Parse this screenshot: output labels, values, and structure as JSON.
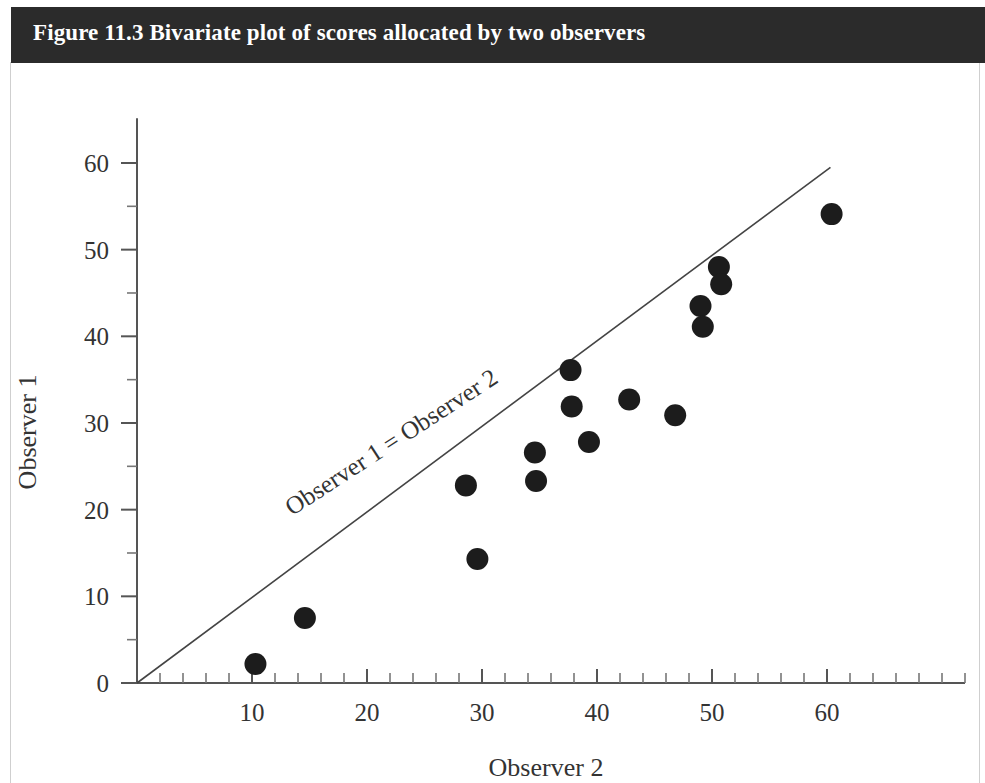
{
  "caption": {
    "text": "Figure 11.3 Bivariate plot of scores allocated by two observers",
    "bar_color": "#2b2b2b",
    "text_color": "#ffffff"
  },
  "chart_data": {
    "type": "scatter",
    "title": "Figure 11.3 Bivariate plot of scores allocated by two observers",
    "xlabel": "Observer 2",
    "ylabel": "Observer 1",
    "xlim": [
      0,
      72
    ],
    "ylim": [
      0,
      64
    ],
    "xticks": [
      10,
      20,
      30,
      40,
      50,
      60
    ],
    "yticks": [
      0,
      10,
      20,
      30,
      40,
      50,
      60
    ],
    "xtick_labels": [
      "10",
      "20",
      "30",
      "40",
      "50",
      "60"
    ],
    "ytick_labels": [
      "0",
      "10",
      "20",
      "30",
      "40",
      "50",
      "60"
    ],
    "x_minor_step": 2,
    "y_minor_step": 5,
    "grid": false,
    "legend": null,
    "marker": "filled-circle",
    "marker_color": "#1c1c1c",
    "marker_size": 11,
    "points": [
      {
        "x": 10.3,
        "y": 2.2
      },
      {
        "x": 14.6,
        "y": 7.5
      },
      {
        "x": 28.6,
        "y": 22.8
      },
      {
        "x": 29.6,
        "y": 14.3
      },
      {
        "x": 34.6,
        "y": 26.6
      },
      {
        "x": 34.7,
        "y": 23.3
      },
      {
        "x": 37.7,
        "y": 36.1
      },
      {
        "x": 37.8,
        "y": 31.9
      },
      {
        "x": 39.3,
        "y": 27.8
      },
      {
        "x": 42.8,
        "y": 32.7
      },
      {
        "x": 46.8,
        "y": 30.9
      },
      {
        "x": 49.0,
        "y": 43.5
      },
      {
        "x": 49.2,
        "y": 41.1
      },
      {
        "x": 50.6,
        "y": 48.0
      },
      {
        "x": 50.8,
        "y": 46.0
      },
      {
        "x": 60.4,
        "y": 54.1
      }
    ],
    "annotations": [
      {
        "text": "Observer 1 = Observer 2",
        "kind": "reference-line-label",
        "rotation_deg": -33
      }
    ],
    "reference_line": {
      "label": "Observer 1 = Observer 2",
      "from": {
        "x": 0,
        "y": 0
      },
      "to": {
        "x": 60.3,
        "y": 59.5
      },
      "color": "#444444"
    }
  }
}
